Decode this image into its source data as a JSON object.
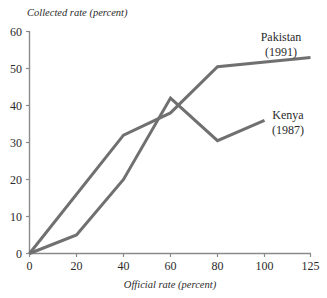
{
  "chart_data": {
    "type": "line",
    "title": "",
    "xlabel": "Official rate (percent)",
    "ylabel": "Collected rate (percent)",
    "x": [
      0,
      20,
      40,
      60,
      80,
      100,
      125
    ],
    "xtick_labels": [
      "0",
      "20",
      "40",
      "60",
      "80",
      "100",
      "125"
    ],
    "ytick_labels": [
      "0",
      "10",
      "20",
      "30",
      "40",
      "50",
      "60"
    ],
    "yticks": [
      0,
      10,
      20,
      30,
      40,
      50,
      60
    ],
    "ylim": [
      0,
      60
    ],
    "xlim": [
      0,
      125
    ],
    "grid": false,
    "legend_position": "inline-annotation",
    "line_color": "#707070",
    "axis_color": "#8a8a8a",
    "background": "#ffffff",
    "series": [
      {
        "name": "Pakistan",
        "year": "(1991)",
        "label_line1": "Pakistan",
        "label_line2": "(1991)",
        "x": [
          0,
          40,
          60,
          80,
          125
        ],
        "values": [
          0,
          32,
          38,
          50.5,
          53
        ]
      },
      {
        "name": "Kenya",
        "year": "(1987)",
        "label_line1": "Kenya",
        "label_line2": "(1987)",
        "x": [
          0,
          20,
          40,
          60,
          80,
          100
        ],
        "values": [
          0,
          5,
          20,
          42,
          30.5,
          36
        ]
      }
    ]
  },
  "annotations": {
    "pakistan_label_line1": "Pakistan",
    "pakistan_label_line2": "(1991)",
    "kenya_label_line1": "Kenya",
    "kenya_label_line2": "(1987)"
  },
  "axis": {
    "y_title": "Collected rate (percent)",
    "x_title": "Official rate (percent)",
    "y_ticks": [
      "60",
      "50",
      "40",
      "30",
      "20",
      "10",
      "0"
    ],
    "x_ticks": [
      "0",
      "20",
      "40",
      "60",
      "80",
      "100",
      "125"
    ]
  }
}
